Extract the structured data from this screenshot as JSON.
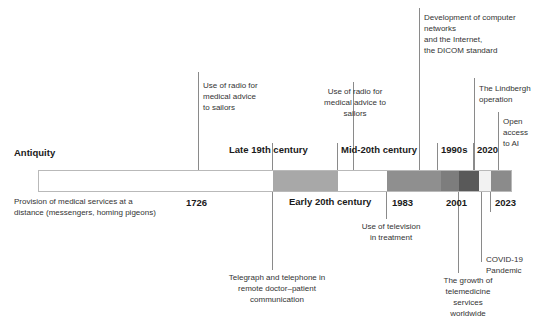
{
  "diagram": {
    "bar": {
      "segments": [
        {
          "name": "antiquity",
          "color": "#ffffff",
          "width": 234
        },
        {
          "name": "late-19th-century",
          "color": "#a8a8a8",
          "width": 65
        },
        {
          "name": "early-20th-century",
          "color": "#ffffff",
          "width": 49
        },
        {
          "name": "mid-20th-century",
          "color": "#8f8f8f",
          "width": 54
        },
        {
          "name": "1983-era",
          "color": "#7d7d7d",
          "width": 18
        },
        {
          "name": "1990s-era",
          "color": "#595959",
          "width": 20
        },
        {
          "name": "2001-era",
          "color": "#f2f2f2",
          "width": 12
        },
        {
          "name": "2020-2023-era",
          "color": "#8b8b8b",
          "width": 20
        }
      ]
    },
    "eras": [
      {
        "name": "antiquity",
        "label": "Antiquity",
        "x": 14,
        "y": 148,
        "align": "left"
      },
      {
        "name": "late-19th-century",
        "label": "Late 19th century",
        "x": 229,
        "y": 145,
        "align": "left"
      },
      {
        "name": "mid-20th-century",
        "label": "Mid-20th century",
        "x": 341,
        "y": 145,
        "align": "left"
      },
      {
        "name": "1990s",
        "label": "1990s",
        "x": 441,
        "y": 145,
        "align": "left"
      },
      {
        "name": "2020",
        "label": "2020",
        "x": 477,
        "y": 145,
        "align": "left"
      },
      {
        "name": "early-20th-century",
        "label": "Early 20th century",
        "x": 289,
        "y": 197,
        "align": "left"
      }
    ],
    "years": [
      {
        "name": "year-1726",
        "label": "1726",
        "x": 186,
        "y": 197
      },
      {
        "name": "year-1983",
        "label": "1983",
        "x": 392,
        "y": 197
      },
      {
        "name": "year-2001",
        "label": "2001",
        "x": 446,
        "y": 197
      },
      {
        "name": "year-2023",
        "label": "2023",
        "x": 495,
        "y": 197
      }
    ],
    "notes_above": [
      {
        "name": "note-radio-sailors-1",
        "text": "Use of radio for\nmedical advice\nto sailors",
        "x": 203,
        "y": 80,
        "w": 95,
        "align": "left"
      },
      {
        "name": "note-radio-sailors-2",
        "text": "Use of radio for\nmedical advice to\nsailors",
        "x": 305,
        "y": 86,
        "w": 100,
        "align": "center"
      },
      {
        "name": "note-computer-networks-dicom",
        "text": "Development of computer\nnetworks\nand the Internet,\nthe DICOM standard",
        "x": 424,
        "y": 12,
        "w": 120,
        "align": "left"
      },
      {
        "name": "note-lindbergh-operation",
        "text": "The Lindbergh\noperation",
        "x": 479,
        "y": 83,
        "w": 64,
        "align": "left"
      },
      {
        "name": "note-open-access-ai",
        "text": "Open\naccess\nto AI",
        "x": 503,
        "y": 116,
        "w": 40,
        "align": "left"
      }
    ],
    "notes_below": [
      {
        "name": "note-telegraph-telephone",
        "text": "Telegraph and telephone in\nremote doctor–patient\ncommunication",
        "x": 203,
        "y": 272,
        "w": 148,
        "align": "center"
      },
      {
        "name": "note-television-treatment",
        "text": "Use of television\nin treatment",
        "x": 339,
        "y": 221,
        "w": 104,
        "align": "center"
      },
      {
        "name": "note-telemedicine-growth",
        "text": "The growth of\ntelemedicine\nservices\nworldwide",
        "x": 422,
        "y": 275,
        "w": 92,
        "align": "center"
      },
      {
        "name": "note-covid-pandemic",
        "text": "COVID-19\nPandemic",
        "x": 486,
        "y": 254,
        "w": 58,
        "align": "left"
      }
    ],
    "description": {
      "name": "description-antiquity",
      "text": "Provision of medical services at a\ndistance (messengers, homing pigeons)",
      "x": 14,
      "y": 196,
      "w": 176
    },
    "connectors": [
      {
        "name": "connector-radio-sailors-1",
        "x": 198,
        "y": 72,
        "h": 98
      },
      {
        "name": "connector-radio-sailors-2",
        "x": 353,
        "y": 82,
        "h": 88
      },
      {
        "name": "connector-computer-networks",
        "x": 419,
        "y": 8,
        "h": 162
      },
      {
        "name": "connector-lindbergh",
        "x": 474,
        "y": 78,
        "h": 92
      },
      {
        "name": "connector-open-access-ai",
        "x": 498,
        "y": 112,
        "h": 58
      },
      {
        "name": "connector-era-divider-1726",
        "x": 272,
        "y": 143,
        "h": 27
      },
      {
        "name": "connector-era-divider-mid20",
        "x": 337,
        "y": 143,
        "h": 27
      },
      {
        "name": "connector-era-divider-1990s",
        "x": 437,
        "y": 143,
        "h": 27
      },
      {
        "name": "connector-era-divider-2020",
        "x": 473,
        "y": 143,
        "h": 27
      },
      {
        "name": "connector-telegraph-telephone",
        "x": 272,
        "y": 192,
        "h": 78
      },
      {
        "name": "connector-television-treatment",
        "x": 386,
        "y": 192,
        "h": 27
      },
      {
        "name": "connector-telemedicine-growth",
        "x": 458,
        "y": 192,
        "h": 81
      },
      {
        "name": "connector-covid-pandemic",
        "x": 481,
        "y": 192,
        "h": 70
      },
      {
        "name": "connector-year-2023",
        "x": 490,
        "y": 192,
        "h": 20
      }
    ]
  }
}
